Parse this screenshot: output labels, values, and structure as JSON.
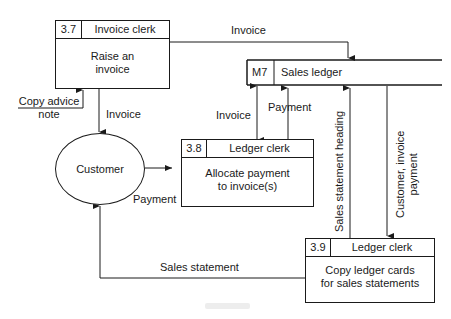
{
  "diagram": {
    "type": "data-flow-diagram",
    "processes": [
      {
        "id": "3.7",
        "role": "Invoice clerk",
        "body_line1": "Raise an",
        "body_line2": "invoice"
      },
      {
        "id": "3.8",
        "role": "Ledger clerk",
        "body_line1": "Allocate payment",
        "body_line2": "to invoice(s)"
      },
      {
        "id": "3.9",
        "role": "Ledger clerk",
        "body_line1": "Copy ledger cards",
        "body_line2": "for sales statements"
      }
    ],
    "data_store": {
      "id": "M7",
      "name": "Sales ledger"
    },
    "external_entity": {
      "name": "Customer"
    },
    "flows": {
      "invoice_to_ledger": "Invoice",
      "copy_advice_line1": "Copy advice",
      "copy_advice_line2": "note",
      "invoice_to_customer": "Invoice",
      "invoice_ledger_38": "Invoice",
      "payment_38_to_ledger": "Payment",
      "payment_customer_to_38": "Payment",
      "sales_statement_heading": "Sales statement heading",
      "customer_invoice_payment_line1": "Customer, invoice",
      "customer_invoice_payment_line2": "payment",
      "sales_statement": "Sales statement"
    },
    "colors": {
      "ink": "#1a1a1a",
      "background": "#ffffff"
    }
  }
}
